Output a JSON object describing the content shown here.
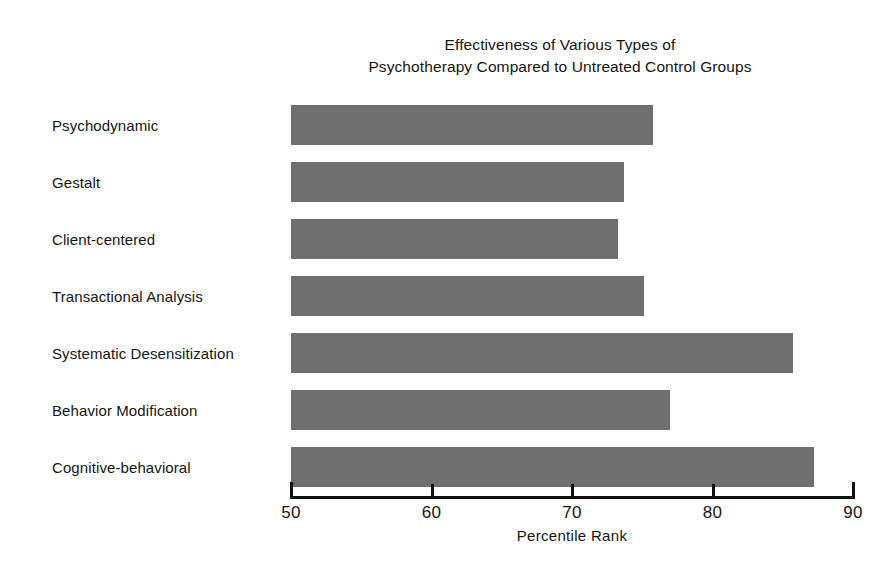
{
  "chart_data": {
    "type": "bar",
    "orientation": "horizontal",
    "title": "Effectiveness of Various Types of Psychotherapy Compared to Untreated Control Groups",
    "title_lines": [
      "Effectiveness of Various Types of",
      "Psychotherapy Compared to Untreated Control Groups"
    ],
    "categories": [
      "Psychodynamic",
      "Gestalt",
      "Client-centered",
      "Transactional Analysis",
      "Systematic Desensitization",
      "Behavior Modification",
      "Cognitive-behavioral"
    ],
    "values": [
      75.8,
      73.7,
      73.3,
      75.1,
      85.7,
      77.0,
      87.2
    ],
    "series": [
      {
        "name": "Percentile Rank",
        "values": [
          75.8,
          73.7,
          73.3,
          75.1,
          85.7,
          77.0,
          87.2
        ]
      }
    ],
    "xlabel": "Percentile Rank",
    "ylabel": "",
    "xlim": [
      50,
      90
    ],
    "xticks": [
      50,
      60,
      70,
      80,
      90
    ],
    "xtick_labels": [
      "50",
      "60",
      "70",
      "80",
      "90"
    ],
    "grid": false,
    "legend": false,
    "bar_color": "#6f6f6f",
    "axis_color": "#111111",
    "background_color": "#ffffff",
    "text_color": "#151515"
  }
}
